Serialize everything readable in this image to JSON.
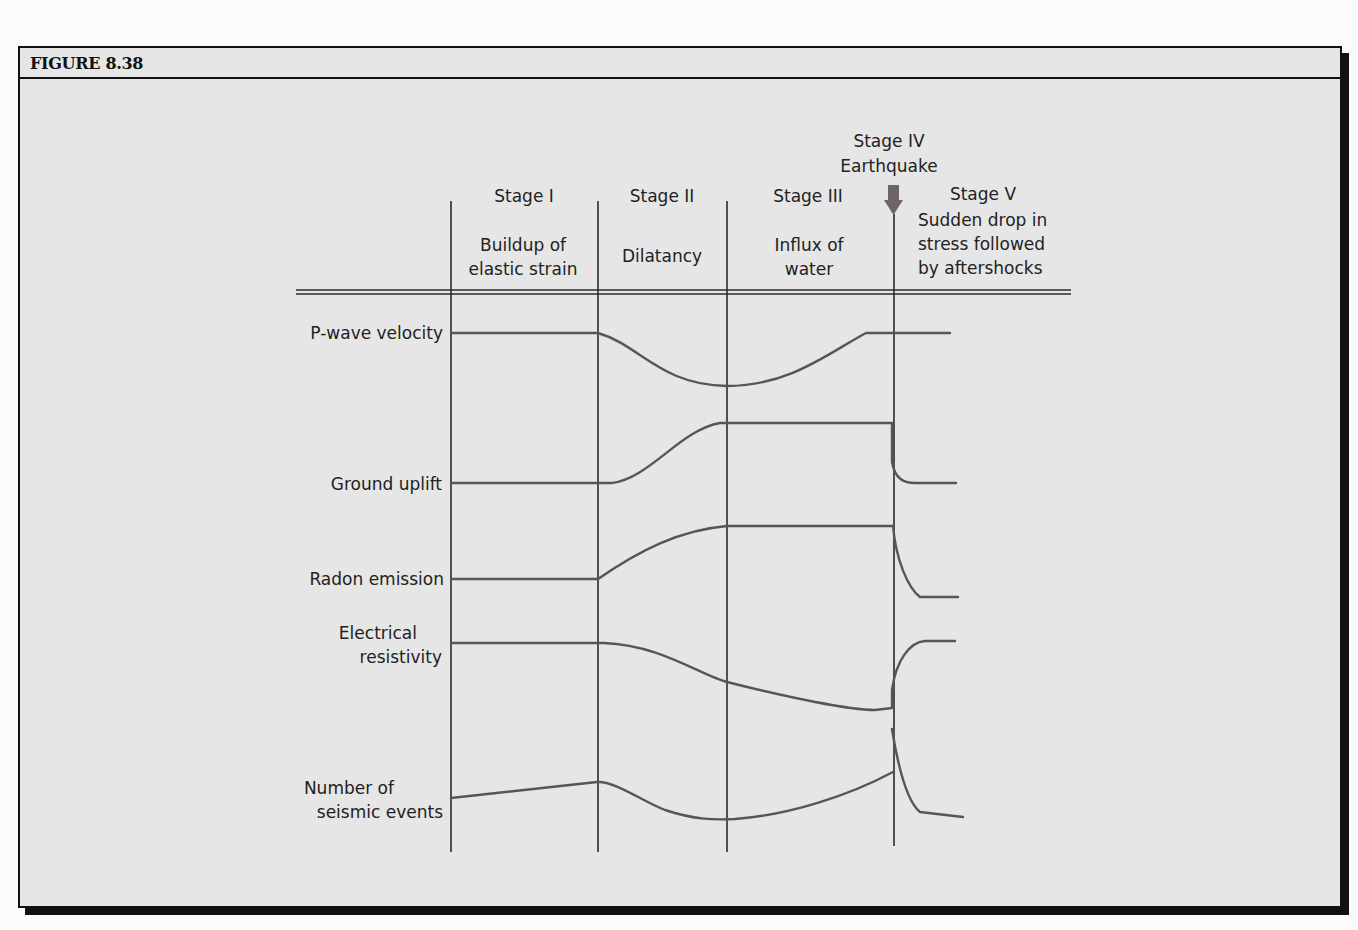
{
  "figure": {
    "title": "FIGURE 8.38"
  },
  "stages": [
    {
      "name": "Stage I",
      "description_lines": [
        "Buildup of",
        "elastic strain"
      ]
    },
    {
      "name": "Stage II",
      "description_lines": [
        "Dilatancy"
      ]
    },
    {
      "name": "Stage III",
      "description_lines": [
        "Influx of",
        "water"
      ]
    },
    {
      "name": "Stage IV",
      "description_lines": [
        "Earthquake"
      ]
    },
    {
      "name": "Stage V",
      "description_lines": [
        "Sudden drop in",
        "stress followed",
        "by aftershocks"
      ]
    }
  ],
  "rows": [
    {
      "label_lines": [
        "P-wave velocity"
      ]
    },
    {
      "label_lines": [
        "Ground uplift"
      ]
    },
    {
      "label_lines": [
        "Radon emission"
      ]
    },
    {
      "label_lines": [
        "Electrical",
        "resistivity"
      ]
    },
    {
      "label_lines": [
        "Number of",
        "seismic events"
      ]
    }
  ],
  "icons": {
    "earthquake_marker": "down-arrow-icon"
  },
  "colors": {
    "curve": "#5a5458",
    "arrow": "#6e6468",
    "grid": "#2a2a2a",
    "background": "#e6e6e6"
  }
}
